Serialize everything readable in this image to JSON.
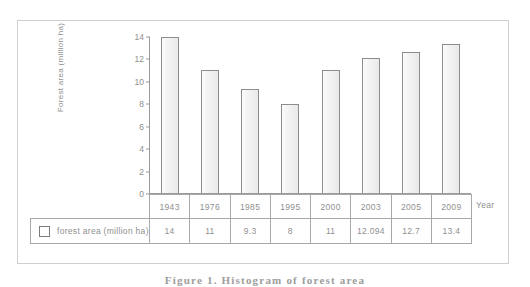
{
  "figure": {
    "caption": "Figure 1. Histogram of forest area",
    "year_axis_label": "Year"
  },
  "legend": {
    "swatch_icon": "square-outline-icon",
    "label": "forest area (million ha)"
  },
  "chart_data": {
    "type": "bar",
    "title": "",
    "xlabel": "Year",
    "ylabel": "Forest area (million ha)",
    "categories": [
      "1943",
      "1976",
      "1985",
      "1995",
      "2000",
      "2003",
      "2005",
      "2009"
    ],
    "values": [
      14,
      11,
      9.3,
      8,
      11,
      12.094,
      12.7,
      13.4
    ],
    "value_labels": [
      "14",
      "11",
      "9.3",
      "8",
      "11",
      "12.094",
      "12.7",
      "13.4"
    ],
    "ylim": [
      0,
      14
    ],
    "yticks": [
      0,
      2,
      4,
      6,
      8,
      10,
      12,
      14
    ],
    "ytick_labels": [
      "0",
      "2",
      "4",
      "6",
      "8",
      "10",
      "12",
      "14"
    ],
    "grid": false,
    "legend_position": "table-left",
    "series": [
      {
        "name": "forest area (million ha)",
        "values": [
          14,
          11,
          9.3,
          8,
          11,
          12.094,
          12.7,
          13.4
        ]
      }
    ],
    "bar_fill_color": "#f2f2f2",
    "bar_edge_color": "#8d8d8d",
    "axis_color": "#9a9a9a",
    "text_color": "#8f8f8f"
  }
}
